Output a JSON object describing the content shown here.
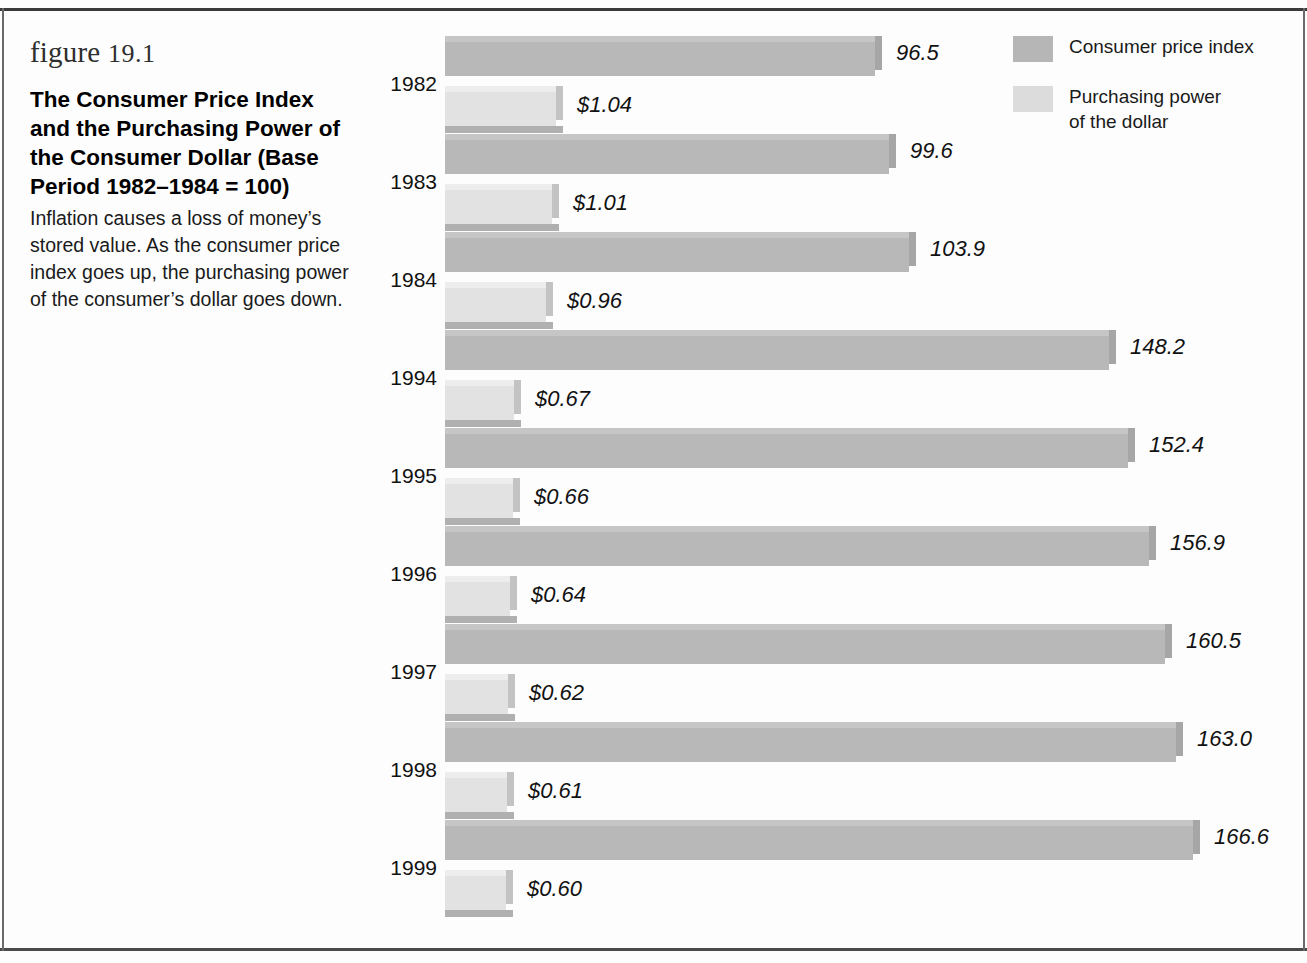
{
  "figure": {
    "number_prefix": "figure",
    "number": "19.1",
    "title": "The Consumer Price Index and the Purchasing Power of the Consumer Dollar (Base Period 1982–1984 = 100)",
    "body": "Inflation causes a loss of money’s stored value. As the consumer price index goes up, the purchasing power of the consumer’s dollar goes down."
  },
  "legend": {
    "items": [
      {
        "label": "Consumer price index",
        "color": "#b6b6b6",
        "key": "cpi"
      },
      {
        "label": "Purchasing power\nof the dollar",
        "color": "#dcdcdc",
        "key": "ppd"
      }
    ]
  },
  "chart_data": {
    "type": "bar",
    "orientation": "horizontal",
    "title": "The Consumer Price Index and the Purchasing Power of the Consumer Dollar (Base Period 1982–1984 = 100)",
    "xlabel": "",
    "ylabel": "",
    "grid": false,
    "legend_position": "top-right",
    "categories": [
      "1982",
      "1983",
      "1984",
      "1994",
      "1995",
      "1996",
      "1997",
      "1998",
      "1999"
    ],
    "series": [
      {
        "name": "Consumer price index",
        "color": "#b8b8b8",
        "values": [
          96.5,
          99.6,
          103.9,
          148.2,
          152.4,
          156.9,
          160.5,
          163.0,
          166.6
        ],
        "labels": [
          "96.5",
          "99.6",
          "103.9",
          "148.2",
          "152.4",
          "156.9",
          "160.5",
          "163.0",
          "166.6"
        ],
        "axis_max": 176
      },
      {
        "name": "Purchasing power of the dollar",
        "color": "#e2e2e2",
        "values": [
          1.04,
          1.01,
          0.96,
          0.67,
          0.66,
          0.64,
          0.62,
          0.61,
          0.6
        ],
        "labels": [
          "$1.04",
          "$1.01",
          "$0.96",
          "$0.67",
          "$0.66",
          "$0.64",
          "$0.62",
          "$0.61",
          "$0.60"
        ],
        "axis_max": 1.55
      }
    ]
  }
}
